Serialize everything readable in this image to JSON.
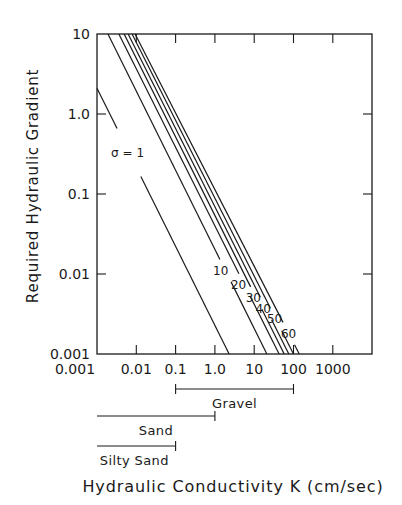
{
  "chart_data": {
    "type": "line",
    "title": "",
    "xlabel": "Hydraulic Conductivity K (cm/sec)",
    "ylabel": "Required Hydraulic Gradient",
    "xscale": "log",
    "yscale": "log",
    "xlim": [
      0.001,
      10000
    ],
    "ylim": [
      0.001,
      10
    ],
    "x_ticks": [
      0.01,
      0.1,
      1.0,
      10,
      100,
      1000
    ],
    "x_tick_labels": [
      "0.001",
      "0.01",
      "0.1",
      "1.0",
      "10",
      "100",
      "1000"
    ],
    "y_tick_labels": [
      "10",
      "1.0",
      "0.1",
      "0.01",
      "0.001"
    ],
    "y_ticks": [
      10,
      1.0,
      0.1,
      0.01,
      0.001
    ],
    "grid": false,
    "legend": "inline labels on lines",
    "relation_note": "Each line: gradient i = c / K (slope -1 on log-log); c ≈ 0.002·σ",
    "series": [
      {
        "name": "σ = 1",
        "label": "σ = 1",
        "c": 0.0021,
        "x": [
          0.001,
          2.3
        ],
        "y": [
          2.1,
          0.001
        ]
      },
      {
        "name": "σ = 10",
        "label": "10",
        "c": 0.02,
        "x": [
          0.0019,
          21
        ],
        "y": [
          10,
          0.001
        ]
      },
      {
        "name": "σ = 20",
        "label": "20",
        "c": 0.038,
        "x": [
          0.0036,
          43
        ],
        "y": [
          10,
          0.001
        ]
      },
      {
        "name": "σ = 30",
        "label": "30",
        "c": 0.052,
        "x": [
          0.0049,
          58
        ],
        "y": [
          10,
          0.001
        ]
      },
      {
        "name": "σ = 40",
        "label": "40",
        "c": 0.068,
        "x": [
          0.0062,
          76
        ],
        "y": [
          10,
          0.001
        ]
      },
      {
        "name": "σ = 50",
        "label": "50",
        "c": 0.09,
        "x": [
          0.0078,
          100
        ],
        "y": [
          10,
          0.001
        ]
      },
      {
        "name": "σ = 60",
        "label": "60",
        "c": 0.115,
        "x": [
          0.0093,
          140
        ],
        "y": [
          10,
          0.001
        ]
      }
    ],
    "annotations": [
      {
        "text": "σ = 1",
        "x": 0.006,
        "y": 0.33
      },
      {
        "text": "10",
        "x": 1.4,
        "y": 0.011
      },
      {
        "text": "20",
        "x": 4.0,
        "y": 0.0073
      },
      {
        "text": "30",
        "x": 9.5,
        "y": 0.005
      },
      {
        "text": "40",
        "x": 17,
        "y": 0.0037
      },
      {
        "text": "50",
        "x": 33,
        "y": 0.0027
      },
      {
        "text": "60",
        "x": 75,
        "y": 0.0018
      }
    ],
    "ranges": [
      {
        "name": "Gravel",
        "from": 0.1,
        "to": 100,
        "row": 0
      },
      {
        "name": "Sand",
        "from": 0.001,
        "to": 1.0,
        "row": 1
      },
      {
        "name": "Silty Sand",
        "from": 0.001,
        "to": 0.1,
        "row": 2
      }
    ]
  },
  "colors": {
    "ink": "#1a1a1a",
    "background": "#ffffff"
  }
}
